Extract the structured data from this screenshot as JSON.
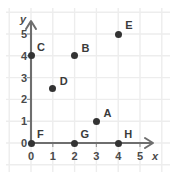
{
  "chart_data": {
    "type": "scatter",
    "title": "",
    "xlabel": "x",
    "ylabel": "y",
    "xlim": [
      0,
      5.6
    ],
    "ylim": [
      0,
      5.6
    ],
    "xticks": [
      "0",
      "1",
      "2",
      "3",
      "4",
      "5"
    ],
    "yticks": [
      "0",
      "1",
      "2",
      "3",
      "4",
      "5"
    ],
    "grid": true,
    "legend": "none",
    "points": [
      {
        "label": "A",
        "x": 3,
        "y": 1,
        "label_dx": 7,
        "label_dy": -13
      },
      {
        "label": "B",
        "x": 2,
        "y": 4,
        "label_dx": 7,
        "label_dy": -13
      },
      {
        "label": "C",
        "x": 0,
        "y": 4,
        "label_dx": 6,
        "label_dy": -14
      },
      {
        "label": "D",
        "x": 1,
        "y": 2.5,
        "label_dx": 7,
        "label_dy": -13
      },
      {
        "label": "E",
        "x": 4,
        "y": 5,
        "label_dx": 7,
        "label_dy": -14
      },
      {
        "label": "F",
        "x": 0,
        "y": 0,
        "label_dx": 6,
        "label_dy": -14
      },
      {
        "label": "G",
        "x": 2,
        "y": 0,
        "label_dx": 6,
        "label_dy": -14
      },
      {
        "label": "H",
        "x": 4,
        "y": 0,
        "label_dx": 6,
        "label_dy": -14
      }
    ],
    "colors": {
      "background": "#ffffff",
      "grid": "#ededed",
      "axis": "#6e6e6e",
      "point": "#333333",
      "text": "#4a4a4a"
    }
  },
  "geometry": {
    "origin_x": 31,
    "origin_y": 143,
    "unit_px": 21.8
  }
}
